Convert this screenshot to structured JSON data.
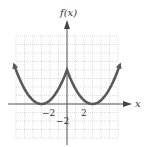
{
  "chart_data": {
    "type": "line",
    "title": "",
    "xlabel": "x",
    "ylabel": "f(x)",
    "xlim": [
      -6,
      6
    ],
    "ylim": [
      -4,
      8
    ],
    "grid": true,
    "x_ticks_labeled": [
      {
        "value": -2,
        "label": "−2"
      },
      {
        "value": 2,
        "label": "2"
      }
    ],
    "y_ticks_labeled": [
      {
        "value": -2,
        "label": "−2"
      }
    ],
    "series": [
      {
        "name": "f(x)",
        "description": "W-shaped curve: two parabolic branches with minima at x=-3 and x=3 (f=0), cusp peak at x=0 (f=4), rising with arrows at both ends",
        "x": [
          -6.2,
          -5,
          -4,
          -3,
          -2,
          -1,
          0,
          1,
          2,
          3,
          4,
          5,
          6.2
        ],
        "y": [
          4.55,
          1.78,
          0.44,
          0,
          0.44,
          1.78,
          4,
          1.78,
          0.44,
          0,
          0.44,
          1.78,
          4.55
        ],
        "color": "#5a5a5a"
      }
    ]
  },
  "labels": {
    "y_axis": "f(x)",
    "x_axis": "x",
    "x_tick_neg2": "−2",
    "x_tick_pos2": "2",
    "y_tick_neg2": "−2"
  },
  "colors": {
    "curve": "#5a5a5a",
    "axis": "#555555",
    "grid": "#c8c8c8"
  }
}
